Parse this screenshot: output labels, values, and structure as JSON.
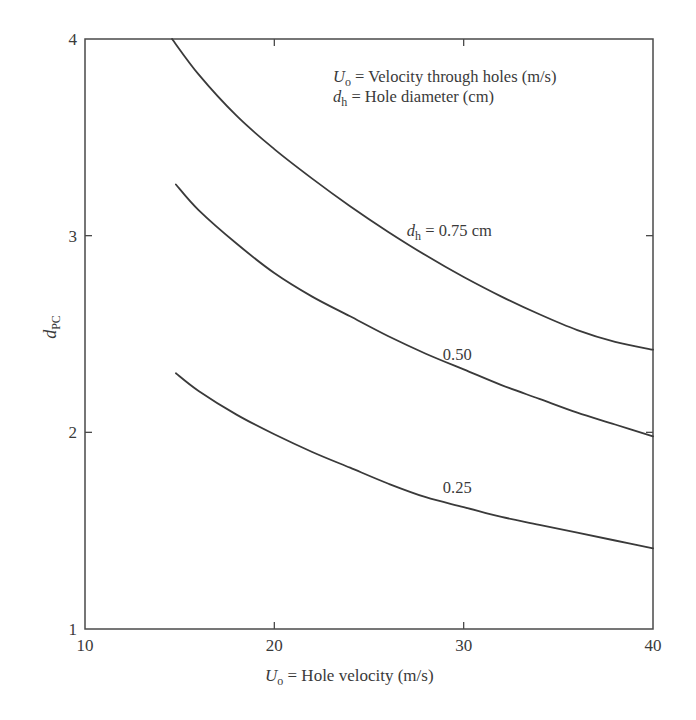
{
  "chart_data": {
    "type": "line",
    "title": "",
    "xlabel": "U_o = Hole velocity (m/s)",
    "xlabel_parts": {
      "symbol": "U",
      "sub": "o",
      "rest": " = Hole velocity (m/s)"
    },
    "ylabel": "d_PC",
    "ylabel_parts": {
      "symbol": "d",
      "sub": "PC"
    },
    "xlim": [
      10,
      40
    ],
    "ylim": [
      1,
      4
    ],
    "x_ticks": [
      10,
      20,
      30,
      40
    ],
    "y_ticks": [
      1,
      2,
      3,
      4
    ],
    "x_tick_labels": [
      "10",
      "20",
      "30",
      "40"
    ],
    "y_tick_labels": [
      "1",
      "2",
      "3",
      "4"
    ],
    "grid": false,
    "legend_position": "none",
    "annotations": [
      {
        "symbol": "U",
        "sub": "o",
        "text": " = Velocity through holes (m/s)"
      },
      {
        "symbol": "d",
        "sub": "h",
        "text": " = Hole diameter (cm)"
      }
    ],
    "series": [
      {
        "name": "d_h = 0.75 cm",
        "label_parts": {
          "symbol": "d",
          "sub": "h",
          "text": " = 0.75 cm"
        },
        "label_pos": [
          27.0,
          3.0
        ],
        "x": [
          14.6,
          16,
          18,
          20,
          22,
          24,
          26,
          28,
          30,
          32,
          34,
          36,
          38,
          40
        ],
        "y": [
          4.0,
          3.82,
          3.61,
          3.44,
          3.29,
          3.15,
          3.02,
          2.9,
          2.79,
          2.69,
          2.6,
          2.52,
          2.46,
          2.42
        ]
      },
      {
        "name": "d_h = 0.50 cm",
        "label_parts": {
          "symbol": "",
          "sub": "",
          "text": "0.50"
        },
        "label_pos": [
          28.9,
          2.37
        ],
        "x": [
          14.8,
          16,
          18,
          20,
          22,
          24,
          26,
          28,
          30,
          32,
          34,
          36,
          38,
          40
        ],
        "y": [
          3.26,
          3.13,
          2.96,
          2.81,
          2.69,
          2.59,
          2.49,
          2.4,
          2.32,
          2.24,
          2.17,
          2.1,
          2.04,
          1.98
        ]
      },
      {
        "name": "d_h = 0.25 cm",
        "label_parts": {
          "symbol": "",
          "sub": "",
          "text": "0.25"
        },
        "label_pos": [
          28.9,
          1.69
        ],
        "x": [
          14.8,
          16,
          18,
          20,
          22,
          24,
          26,
          28,
          30,
          32,
          34,
          36,
          38,
          40
        ],
        "y": [
          2.3,
          2.21,
          2.09,
          1.99,
          1.9,
          1.82,
          1.74,
          1.67,
          1.62,
          1.57,
          1.53,
          1.49,
          1.45,
          1.41
        ]
      }
    ]
  }
}
